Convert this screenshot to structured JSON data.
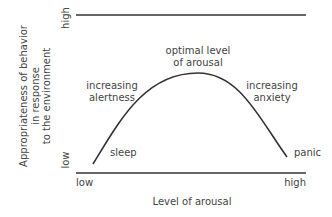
{
  "diagram": {
    "y_axis": {
      "label_lines": [
        "Appropriateness of behavior",
        "in response",
        "to the environment"
      ],
      "high": "high",
      "low": "low"
    },
    "x_axis": {
      "label": "Level of arousal",
      "low": "low",
      "high": "high"
    },
    "annotations": {
      "peak_line1": "optimal level",
      "peak_line2": "of arousal",
      "left_line1": "increasing",
      "left_line2": "alertness",
      "right_line1": "increasing",
      "right_line2": "anxiety",
      "start": "sleep",
      "end": "panic"
    },
    "colors": {
      "line": "#333333",
      "text": "#444444"
    }
  }
}
